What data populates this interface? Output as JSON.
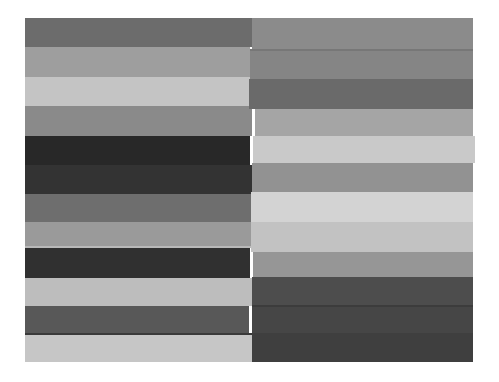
{
  "image": {
    "scene": "Grayscale photograph of two side-by-side stacks of horizontal striped bands (folded-fabric-like gray stripes) on a white background",
    "background_color": "#ffffff",
    "canvas": {
      "width": 499,
      "height": 382
    },
    "content_rect": {
      "left": 25,
      "top": 18,
      "right": 473,
      "bottom": 362
    },
    "split_x": 252
  },
  "panels": [
    {
      "name": "left-stripe-stack",
      "bands": [
        {
          "top": 18,
          "bottom": 47,
          "left": 25,
          "right": 252,
          "color": "#6c6c6c"
        },
        {
          "top": 47,
          "bottom": 77,
          "left": 25,
          "right": 250,
          "color": "#9e9e9e"
        },
        {
          "top": 77,
          "bottom": 106,
          "left": 25,
          "right": 252,
          "color": "#c4c4c4"
        },
        {
          "top": 106,
          "bottom": 136,
          "left": 25,
          "right": 252,
          "color": "#8a8a8a"
        },
        {
          "top": 136,
          "bottom": 165,
          "left": 25,
          "right": 250,
          "color": "#282828"
        },
        {
          "top": 165,
          "bottom": 194,
          "left": 25,
          "right": 252,
          "color": "#333333"
        },
        {
          "top": 194,
          "bottom": 222,
          "left": 25,
          "right": 252,
          "color": "#6e6e6e"
        },
        {
          "top": 222,
          "bottom": 248,
          "left": 25,
          "right": 253,
          "color": "#9a9a9a",
          "seam_bottom": "#b8b8b8"
        },
        {
          "top": 248,
          "bottom": 278,
          "left": 25,
          "right": 250,
          "color": "#303030"
        },
        {
          "top": 278,
          "bottom": 306,
          "left": 25,
          "right": 252,
          "color": "#bdbdbd"
        },
        {
          "top": 306,
          "bottom": 333,
          "left": 25,
          "right": 249,
          "color": "#585858"
        },
        {
          "top": 333,
          "bottom": 362,
          "left": 25,
          "right": 252,
          "color": "#c6c6c6",
          "seam_top": "#3a3a3a"
        }
      ]
    },
    {
      "name": "right-stripe-stack",
      "bands": [
        {
          "top": 18,
          "bottom": 49,
          "left": 252,
          "right": 473,
          "color": "#8b8b8b"
        },
        {
          "top": 49,
          "bottom": 79,
          "left": 250,
          "right": 473,
          "color": "#858585",
          "seam_top": "#777777"
        },
        {
          "top": 79,
          "bottom": 109,
          "left": 249,
          "right": 473,
          "color": "#6a6a6a"
        },
        {
          "top": 109,
          "bottom": 136,
          "left": 255,
          "right": 473,
          "color": "#a5a5a5"
        },
        {
          "top": 136,
          "bottom": 163,
          "left": 253,
          "right": 475,
          "color": "#c9c9c9"
        },
        {
          "top": 163,
          "bottom": 192,
          "left": 252,
          "right": 473,
          "color": "#929292"
        },
        {
          "top": 192,
          "bottom": 222,
          "left": 251,
          "right": 473,
          "color": "#d3d3d3"
        },
        {
          "top": 222,
          "bottom": 252,
          "left": 251,
          "right": 473,
          "color": "#c2c2c2"
        },
        {
          "top": 252,
          "bottom": 277,
          "left": 253,
          "right": 473,
          "color": "#969696"
        },
        {
          "top": 277,
          "bottom": 305,
          "left": 252,
          "right": 473,
          "color": "#4d4d4d"
        },
        {
          "top": 305,
          "bottom": 333,
          "left": 252,
          "right": 473,
          "color": "#464646",
          "seam_top": "#3c3c3c"
        },
        {
          "top": 333,
          "bottom": 362,
          "left": 252,
          "right": 473,
          "color": "#3f3f3f"
        }
      ]
    }
  ]
}
